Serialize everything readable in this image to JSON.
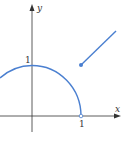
{
  "figure": {
    "axes": {
      "x_label": "x",
      "y_label": "y",
      "x_tick_label": "1",
      "y_tick_label": "1"
    },
    "colors": {
      "curve": "#4a7fd0",
      "axis": "#333333"
    },
    "pieces": [
      {
        "type": "arc",
        "description": "upper unit semicircle from x<0 to x=1",
        "end_marker": "open circle at (1,0)"
      },
      {
        "type": "line",
        "description": "ray starting at (1,1) going up-right",
        "start_marker": "filled dot at (1,1)"
      }
    ]
  }
}
